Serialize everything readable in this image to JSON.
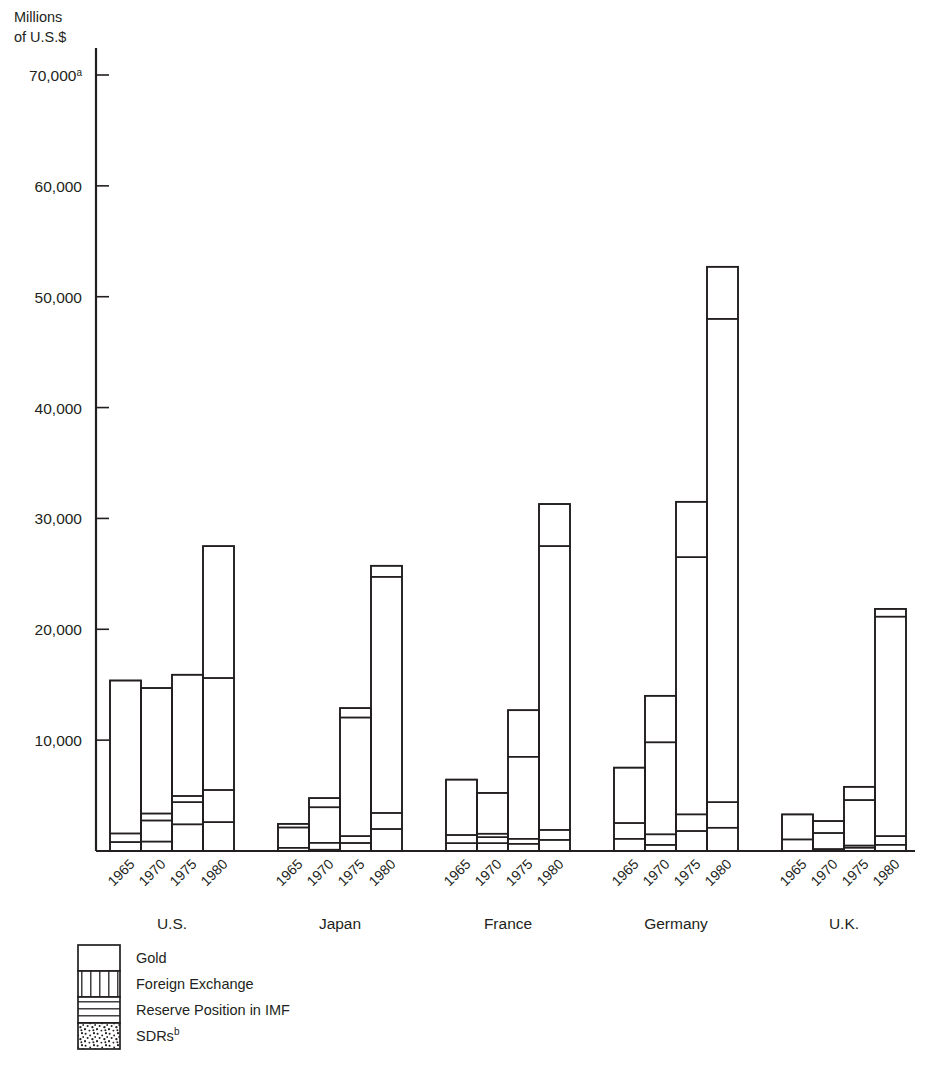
{
  "chart_data": {
    "type": "bar",
    "subtype": "stacked-grouped",
    "title": "",
    "ylabel_line1": "Millions",
    "ylabel_line2": "of U.S.$",
    "xlabel": "",
    "ylim": [
      0,
      70000
    ],
    "yticks": [
      10000,
      20000,
      30000,
      40000,
      50000,
      60000,
      70000
    ],
    "ytick_labels": [
      "10,000",
      "20,000",
      "30,000",
      "40,000",
      "50,000",
      "60,000",
      "70,000"
    ],
    "ytick_top_superscript": "a",
    "grid": false,
    "legend_position": "bottom-left",
    "categories": [
      "1965",
      "1970",
      "1975",
      "1980"
    ],
    "groups": [
      "U.S.",
      "Japan",
      "France",
      "Germany",
      "U.K."
    ],
    "series": [
      {
        "name": "Gold",
        "pattern": "blank"
      },
      {
        "name": "Foreign Exchange",
        "pattern": "vertical-lines"
      },
      {
        "name": "Reserve Position in IMF",
        "pattern": "horizontal-lines"
      },
      {
        "name": "SDRs",
        "pattern": "stipple",
        "superscript": "b"
      }
    ],
    "data": [
      {
        "group": "U.S.",
        "bars": [
          {
            "year": "1965",
            "sdrs": 0,
            "imf": 800,
            "fx": 780,
            "gold": 13800,
            "total": 15380
          },
          {
            "year": "1970",
            "sdrs": 850,
            "imf": 1900,
            "fx": 630,
            "gold": 11320,
            "total": 14700
          },
          {
            "year": "1975",
            "sdrs": 2400,
            "imf": 2000,
            "fx": 560,
            "gold": 10940,
            "total": 15900
          },
          {
            "year": "1980",
            "sdrs": 2600,
            "imf": 2900,
            "fx": 10100,
            "gold": 11900,
            "total": 27500
          }
        ]
      },
      {
        "group": "Japan",
        "bars": [
          {
            "year": "1965",
            "sdrs": 0,
            "imf": 290,
            "fx": 1830,
            "gold": 330,
            "total": 2450
          },
          {
            "year": "1970",
            "sdrs": 120,
            "imf": 620,
            "fx": 3200,
            "gold": 830,
            "total": 4770
          },
          {
            "year": "1975",
            "sdrs": 720,
            "imf": 620,
            "fx": 10700,
            "gold": 850,
            "total": 12890
          },
          {
            "year": "1980",
            "sdrs": 1980,
            "imf": 1450,
            "fx": 21300,
            "gold": 1000,
            "total": 25730
          }
        ]
      },
      {
        "group": "France",
        "bars": [
          {
            "year": "1965",
            "sdrs": 0,
            "imf": 700,
            "fx": 740,
            "gold": 5000,
            "total": 6440
          },
          {
            "year": "1970",
            "sdrs": 700,
            "imf": 540,
            "fx": 320,
            "gold": 3680,
            "total": 5240
          },
          {
            "year": "1975",
            "sdrs": 650,
            "imf": 450,
            "fx": 7400,
            "gold": 4200,
            "total": 12700
          },
          {
            "year": "1980",
            "sdrs": 1000,
            "imf": 900,
            "fx": 25600,
            "gold": 3800,
            "total": 31300
          }
        ]
      },
      {
        "group": "Germany",
        "bars": [
          {
            "year": "1965",
            "sdrs": 0,
            "imf": 1100,
            "fx": 1420,
            "gold": 5000,
            "total": 7520
          },
          {
            "year": "1970",
            "sdrs": 550,
            "imf": 950,
            "fx": 8300,
            "gold": 4200,
            "total": 14000
          },
          {
            "year": "1975",
            "sdrs": 1800,
            "imf": 1500,
            "fx": 23200,
            "gold": 5000,
            "total": 31500
          },
          {
            "year": "1980",
            "sdrs": 2100,
            "imf": 2300,
            "fx": 43600,
            "gold": 4700,
            "total": 52700
          }
        ]
      },
      {
        "group": "U.K.",
        "bars": [
          {
            "year": "1965",
            "sdrs": 0,
            "imf": 0,
            "fx": 1040,
            "gold": 2260,
            "total": 3300
          },
          {
            "year": "1970",
            "sdrs": 170,
            "imf": 0,
            "fx": 1450,
            "gold": 1080,
            "total": 2700
          },
          {
            "year": "1975",
            "sdrs": 300,
            "imf": 190,
            "fx": 4100,
            "gold": 1200,
            "total": 5790
          },
          {
            "year": "1980",
            "sdrs": 560,
            "imf": 780,
            "fx": 19800,
            "gold": 700,
            "total": 21840
          }
        ]
      }
    ]
  }
}
